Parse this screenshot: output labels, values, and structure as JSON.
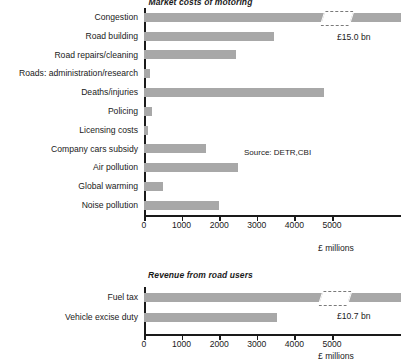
{
  "chart_data": [
    {
      "type": "bar",
      "orientation": "horizontal",
      "title": "Market costs of motoring",
      "xlabel": "£ millions",
      "ylabel": "",
      "categories": [
        "Congestion",
        "Road building",
        "Road repairs/cleaning",
        "Roads: administration/research",
        "Deaths/injuries",
        "Policing",
        "Licensing costs",
        "Company cars subsidy",
        "Air pollution",
        "Global warming",
        "Noise pollution"
      ],
      "values": [
        15000,
        3450,
        2450,
        170,
        4800,
        220,
        100,
        1650,
        2500,
        500,
        2000
      ],
      "xlim": [
        0,
        5000
      ],
      "xticks": [
        0,
        1000,
        2000,
        3000,
        4000,
        5000
      ],
      "xtick_labels": [
        "0",
        "1000",
        "2000",
        "3000",
        "4000",
        "5000"
      ],
      "grid": false,
      "legend": "none",
      "broken_axis": true,
      "broken_bars": [
        {
          "category": "Congestion",
          "label": "£15.0 bn",
          "break_at": 4750
        }
      ],
      "annotations": [
        {
          "text": "Source: DETR,CBI",
          "x": 2850,
          "y": "Company cars subsidy"
        }
      ],
      "bar_color": "#a8a8a8"
    },
    {
      "type": "bar",
      "orientation": "horizontal",
      "title": "Revenue from road users",
      "xlabel": "£ millions",
      "ylabel": "",
      "categories": [
        "Fuel tax",
        "Vehicle excise duty"
      ],
      "values": [
        10700,
        3550
      ],
      "xlim": [
        0,
        5000
      ],
      "xticks": [
        0,
        1000,
        2000,
        3000,
        4000,
        5000
      ],
      "xtick_labels": [
        "0",
        "1000",
        "2000",
        "3000",
        "4000",
        "5000"
      ],
      "grid": false,
      "legend": "none",
      "broken_axis": true,
      "broken_bars": [
        {
          "category": "Fuel tax",
          "label": "£10.7 bn",
          "break_at": 4700
        }
      ],
      "annotations": [],
      "bar_color": "#a8a8a8"
    }
  ],
  "top_chart": {
    "title": "Market costs of motoring",
    "unit": "£ millions",
    "source": "Source: DETR,CBI",
    "break_label": "£15.0 bn",
    "categories": [
      {
        "label": "Congestion",
        "value": 15000
      },
      {
        "label": "Road building",
        "value": 3450
      },
      {
        "label": "Road repairs/cleaning",
        "value": 2450
      },
      {
        "label": "Roads: administration/research",
        "value": 170
      },
      {
        "label": "Deaths/injuries",
        "value": 4800
      },
      {
        "label": "Policing",
        "value": 220
      },
      {
        "label": "Licensing costs",
        "value": 100
      },
      {
        "label": "Company cars subsidy",
        "value": 1650
      },
      {
        "label": "Air pollution",
        "value": 2500
      },
      {
        "label": "Global warming",
        "value": 500
      },
      {
        "label": "Noise pollution",
        "value": 2000
      }
    ],
    "ticks": [
      "0",
      "1000",
      "2000",
      "3000",
      "4000",
      "5000"
    ]
  },
  "bottom_chart": {
    "title": "Revenue from road users",
    "unit": "£ millions",
    "break_label": "£10.7 bn",
    "categories": [
      {
        "label": "Fuel tax",
        "value": 10700
      },
      {
        "label": "Vehicle excise duty",
        "value": 3550
      }
    ],
    "ticks": [
      "0",
      "1000",
      "2000",
      "3000",
      "4000",
      "5000"
    ]
  },
  "colors": {
    "bar": "#a8a8a8",
    "axis": "#1a1a1a",
    "background": "#ffffff"
  }
}
